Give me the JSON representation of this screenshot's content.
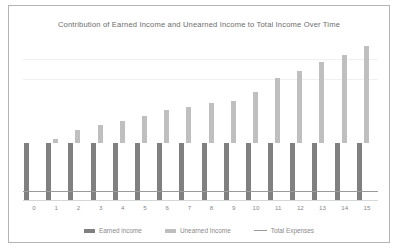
{
  "chart_data": {
    "type": "bar",
    "title": "Contribution of Earned Income and Unearned Income to Total Income Over Time",
    "xlabel": "",
    "ylabel": "",
    "categories": [
      "0",
      "1",
      "2",
      "3",
      "4",
      "5",
      "6",
      "7",
      "8",
      "9",
      "10",
      "11",
      "12",
      "13",
      "14",
      "15"
    ],
    "series": [
      {
        "name": "Earned income",
        "color": "#808080",
        "type": "bar",
        "values": [
          -100,
          -100,
          -100,
          -100,
          -100,
          -100,
          -100,
          -100,
          -100,
          -100,
          -100,
          -100,
          -100,
          -100,
          -100,
          -100
        ]
      },
      {
        "name": "Unearned Income",
        "color": "#bfbfbf",
        "type": "bar",
        "values": [
          0,
          8,
          22,
          32,
          38,
          47,
          58,
          62,
          70,
          73,
          88,
          112,
          124,
          140,
          152,
          168
        ]
      },
      {
        "name": "Total Expenses",
        "color": "#9a9a9a",
        "type": "line",
        "constant_value": -85,
        "values": [
          -85,
          -85,
          -85,
          -85,
          -85,
          -85,
          -85,
          -85,
          -85,
          -85,
          -85,
          -85,
          -85,
          -85,
          -85,
          -85
        ]
      }
    ],
    "ylim": [
      -100,
      180
    ],
    "grid": true,
    "gridlines": [
      60,
      120
    ],
    "legend_position": "bottom"
  },
  "legend": {
    "items": [
      {
        "label": "Earned income",
        "marker": "bar",
        "color": "#808080"
      },
      {
        "label": "Unearned Income",
        "marker": "bar",
        "color": "#bfbfbf"
      },
      {
        "label": "Total Expenses",
        "marker": "line",
        "color": "#9a9a9a"
      }
    ]
  },
  "colors": {
    "earned": "#808080",
    "unearned": "#bfbfbf",
    "expenses": "#9a9a9a",
    "grid": "#eef0f1",
    "axis": "#d5d7d9",
    "border": "#b4b4b4",
    "text": "#6d6d6d"
  }
}
